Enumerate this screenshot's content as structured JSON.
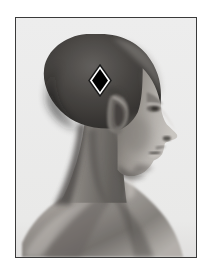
{
  "figure": {
    "kind": "anatomical-photograph",
    "view": "lateral profile, head and shoulders",
    "subject_description": "Profile of a person with closely shaved hair, facing right",
    "background_color": "#ffffff",
    "frame_color": "#3a3a3a",
    "frame_width_px": 1.5,
    "plate_color": "#fdfdfd"
  },
  "markers": [
    {
      "name": "landmark-diamond",
      "shape": "diamond",
      "fill_color": "#000000",
      "outline_color": "#ffffff",
      "outline_width_px": 2,
      "border_color": "#1a1a1a",
      "location_label": "parietal region, superior-posterior to the ear",
      "x_px": 72,
      "y_px": 46,
      "width_px": 24,
      "height_px": 33
    }
  ],
  "tones": {
    "skin_light": "#d8d4cf",
    "skin_mid": "#a09b95",
    "skin_shadow": "#6e6a66",
    "hair_dark": "#4a4845",
    "hair_darkest": "#343230",
    "highlight": "#efeeec",
    "deep_shadow": "#2a2826"
  },
  "labels": {
    "figure_caption": "",
    "marker_caption": ""
  }
}
